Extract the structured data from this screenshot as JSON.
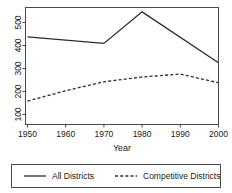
{
  "chart_data": {
    "type": "line",
    "title": "",
    "subtitle": "",
    "xlabel": "Year",
    "ylabel": "",
    "x": [
      1950,
      1960,
      1970,
      1980,
      1990,
      2000
    ],
    "xticklabels": [
      "1950",
      "1960",
      "1970",
      "1980",
      "1990",
      "2000"
    ],
    "yticks": [
      100,
      200,
      300,
      400,
      500
    ],
    "yticklabels": [
      "100",
      "200",
      "300",
      "400",
      "500"
    ],
    "xlim": [
      1950,
      2000
    ],
    "ylim": [
      85,
      570
    ],
    "grid": false,
    "legend_position": "below-plot",
    "series": [
      {
        "name": "All Districts",
        "style": "solid",
        "color": "#2b2b2b",
        "x": [
          1950,
          1970,
          1980,
          2000
        ],
        "values": [
          448,
          421,
          552,
          341
        ]
      },
      {
        "name": "Competitive Districts",
        "style": "dashed",
        "color": "#2b2b2b",
        "x": [
          1950,
          1960,
          1970,
          1980,
          1990,
          2000
        ],
        "values": [
          182,
          225,
          262,
          282,
          294,
          258
        ]
      }
    ]
  },
  "axes": {
    "x_title": "Year",
    "x_ticks": [
      "1950",
      "1960",
      "1970",
      "1980",
      "1990",
      "2000"
    ],
    "y_ticks": [
      "100",
      "200",
      "300",
      "400",
      "500"
    ]
  },
  "legend": {
    "entries": [
      {
        "label": "All Districts",
        "style": "solid"
      },
      {
        "label": "Competitive Districts",
        "style": "dashed"
      }
    ]
  }
}
